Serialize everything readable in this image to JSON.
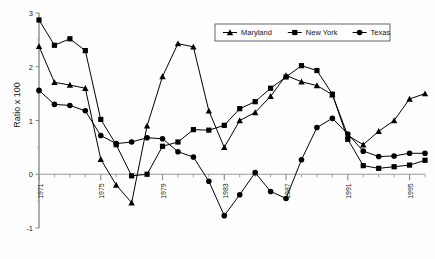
{
  "chart_data": {
    "type": "line",
    "title": "",
    "subtitle": "",
    "xlabel": "",
    "ylabel": "Ratio x 100",
    "xlim": [
      1971,
      1996
    ],
    "ylim": [
      -1,
      3
    ],
    "ytick_labels": [
      "3",
      "2",
      "1",
      "0",
      "-1"
    ],
    "ytick_values": [
      3,
      2,
      1,
      0,
      -1
    ],
    "xtick_labels": [
      "1971",
      "1975",
      "1979",
      "1983",
      "1987",
      "1991",
      "1995"
    ],
    "xtick_values": [
      1971,
      1975,
      1979,
      1983,
      1987,
      1991,
      1995
    ],
    "grid": false,
    "legend_position": "top-right",
    "x": [
      1971,
      1972,
      1973,
      1974,
      1975,
      1976,
      1977,
      1978,
      1979,
      1980,
      1981,
      1982,
      1983,
      1984,
      1985,
      1986,
      1987,
      1988,
      1989,
      1990,
      1991,
      1992,
      1993,
      1994,
      1995,
      1996
    ],
    "series": [
      {
        "name": "Maryland",
        "marker": "triangle",
        "color": "#000000",
        "values": [
          2.38,
          1.71,
          1.66,
          1.6,
          0.28,
          -0.2,
          -0.53,
          0.9,
          1.82,
          2.43,
          2.37,
          1.18,
          0.5,
          1.0,
          1.15,
          1.45,
          1.84,
          1.72,
          1.65,
          1.48,
          0.72,
          0.55,
          0.8,
          1.0,
          1.4,
          1.5
        ]
      },
      {
        "name": "New York",
        "marker": "square",
        "color": "#000000",
        "values": [
          2.87,
          2.4,
          2.52,
          2.3,
          1.02,
          0.55,
          -0.03,
          0.0,
          0.52,
          0.6,
          0.83,
          0.82,
          0.91,
          1.22,
          1.35,
          1.6,
          1.81,
          2.02,
          1.93,
          1.49,
          0.65,
          0.16,
          0.11,
          0.14,
          0.17,
          0.26
        ]
      },
      {
        "name": "Texas",
        "marker": "circle",
        "color": "#000000",
        "values": [
          1.56,
          1.3,
          1.28,
          1.18,
          0.72,
          0.57,
          0.6,
          0.68,
          0.66,
          0.42,
          0.32,
          -0.13,
          -0.77,
          -0.38,
          0.03,
          -0.32,
          -0.45,
          0.27,
          0.87,
          1.04,
          0.75,
          0.43,
          0.33,
          0.34,
          0.39,
          0.39
        ]
      }
    ]
  },
  "legend": {
    "items": [
      {
        "label": "Maryland",
        "marker": "triangle"
      },
      {
        "label": "New York",
        "marker": "square"
      },
      {
        "label": "Texas",
        "marker": "circle"
      }
    ]
  }
}
